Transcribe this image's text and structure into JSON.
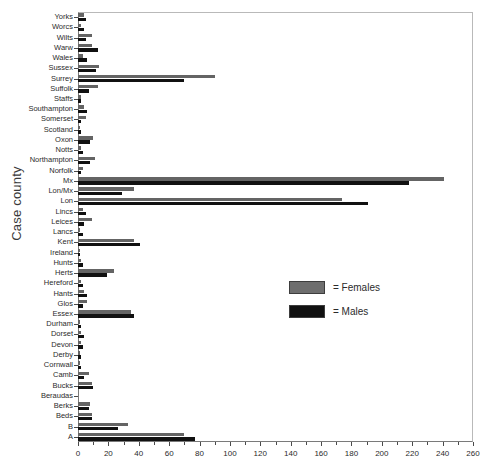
{
  "chart_data": {
    "type": "bar",
    "orientation": "horizontal",
    "title": "",
    "xlabel": "",
    "ylabel": "Case county",
    "xlim": [
      0,
      260
    ],
    "xticks": [
      0,
      20,
      40,
      60,
      80,
      100,
      120,
      140,
      160,
      180,
      200,
      220,
      240,
      260
    ],
    "grid": false,
    "legend_position": "center-right",
    "categories": [
      "Yorks",
      "Worcs",
      "Wilts",
      "Warw",
      "Wales",
      "Sussex",
      "Surrey",
      "Suffolk",
      "Staffs",
      "Southampton",
      "Somerset",
      "Scotland",
      "Oxon",
      "Notts",
      "Northampton",
      "Norfolk",
      "Mx",
      "Lon/Mx",
      "Lon",
      "Lincs",
      "Leices",
      "Lancs",
      "Kent",
      "Ireland",
      "Hunts",
      "Herts",
      "Hereford",
      "Hants",
      "Glos",
      "Essex",
      "Durham",
      "Dorset",
      "Devon",
      "Derby",
      "Cornwall",
      "Camb",
      "Bucks",
      "Beraudas",
      "Berks",
      "Beds",
      "B",
      "A"
    ],
    "series": [
      {
        "name": "Females",
        "color": "#646464",
        "values": [
          4,
          2,
          9,
          9,
          3,
          14,
          90,
          13,
          2,
          4,
          5,
          1,
          10,
          2,
          11,
          3,
          241,
          37,
          174,
          3,
          9,
          1,
          37,
          1,
          2,
          24,
          2,
          4,
          6,
          35,
          1,
          2,
          2,
          1,
          1,
          7,
          9,
          0,
          8,
          9,
          33,
          70
        ]
      },
      {
        "name": "Males",
        "color": "#111111",
        "values": [
          5,
          4,
          5,
          13,
          6,
          12,
          70,
          7,
          2,
          6,
          2,
          2,
          8,
          3,
          8,
          2,
          218,
          29,
          191,
          5,
          4,
          3,
          41,
          1,
          3,
          19,
          3,
          6,
          3,
          37,
          2,
          4,
          3,
          2,
          2,
          4,
          10,
          0,
          7,
          9,
          26,
          77
        ]
      }
    ]
  },
  "legend": {
    "females_label": "= Females",
    "males_label": "= Males"
  }
}
